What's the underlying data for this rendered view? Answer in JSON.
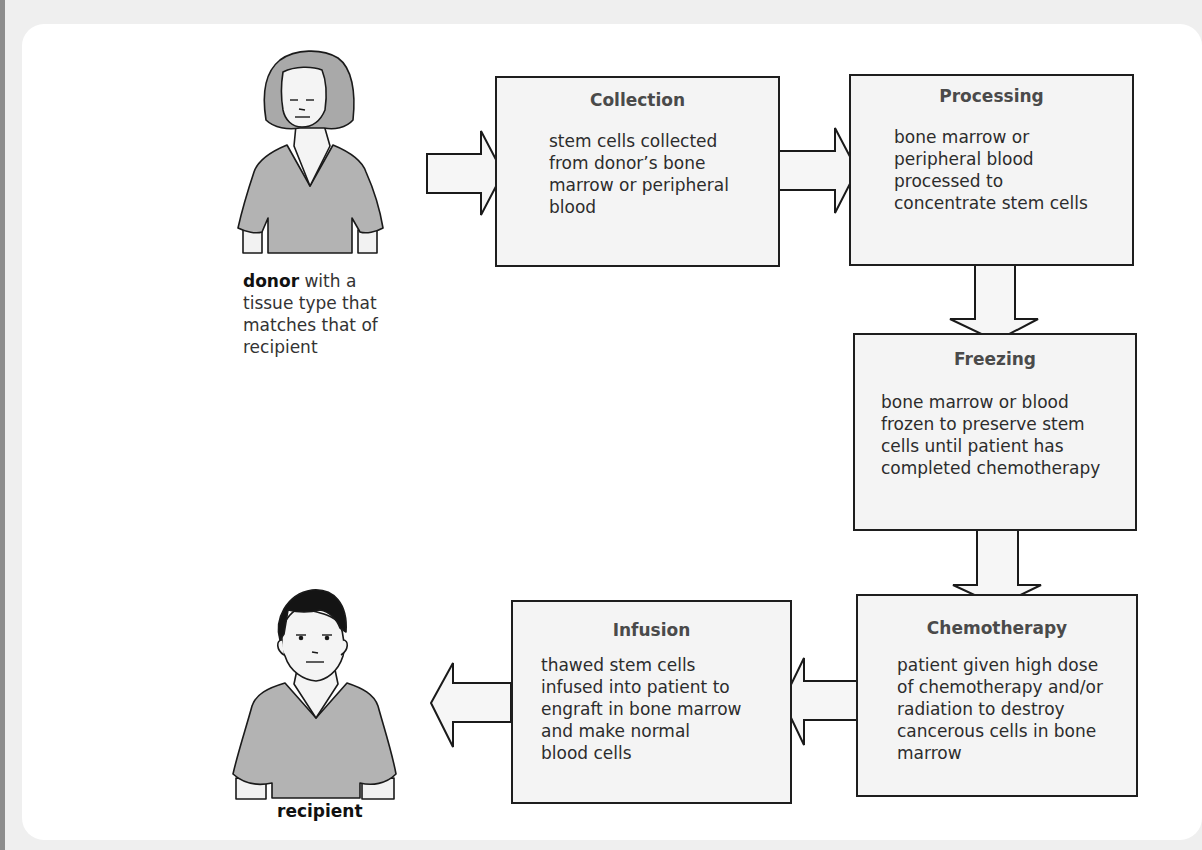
{
  "diagram": {
    "type": "flowchart",
    "donor": {
      "label_bold": "donor",
      "label_rest": " with a\ntissue type that\nmatches that of\nrecipient"
    },
    "recipient": {
      "label": "recipient"
    },
    "steps": [
      {
        "id": "collection",
        "title": "Collection",
        "body": "stem cells collected\nfrom donor’s bone\nmarrow or peripheral\nblood"
      },
      {
        "id": "processing",
        "title": "Processing",
        "body": "bone marrow or\nperipheral blood\nprocessed to\nconcentrate stem cells"
      },
      {
        "id": "freezing",
        "title": "Freezing",
        "body": "bone marrow or blood\nfrozen to preserve stem\ncells until patient has\ncompleted chemotherapy"
      },
      {
        "id": "chemotherapy",
        "title": "Chemotherapy",
        "body": "patient given high dose\nof chemotherapy and/or\nradiation to destroy\ncancerous cells in bone\nmarrow"
      },
      {
        "id": "infusion",
        "title": "Infusion",
        "body": "thawed stem cells\ninfused into patient to\nengraft in bone marrow\nand make normal\nblood cells"
      }
    ],
    "flow": [
      "donor",
      "collection",
      "processing",
      "freezing",
      "chemotherapy",
      "infusion",
      "recipient"
    ],
    "colors": {
      "box_fill": "#f4f4f4",
      "box_border": "#1e1e1e",
      "shirt": "#b3b3b3",
      "donor_hair": "#a9a9a9",
      "recipient_hair": "#111111",
      "background": "#efefef"
    }
  }
}
